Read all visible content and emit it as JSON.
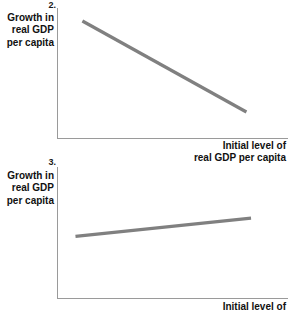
{
  "page": {
    "background": "#ffffff",
    "text_color": "#111111",
    "axis_color": "#9a9a9a",
    "line_color": "#808080"
  },
  "figures": [
    {
      "number": "2.",
      "y_axis_label_lines": [
        "Growth in",
        "real GDP",
        "per capita"
      ],
      "x_axis_label_lines": [
        "Initial level of",
        "real GDP per capita"
      ],
      "chart_data": {
        "type": "line",
        "title": "2.",
        "xlabel": "Initial level of real GDP per capita",
        "ylabel": "Growth in real GDP per capita",
        "grid": false,
        "legend": "none",
        "axis_ticks": "none",
        "series": [
          {
            "name": "negative relationship",
            "relationship": "decreasing",
            "x": [
              0.11,
              0.82
            ],
            "y": [
              0.9,
              0.2
            ]
          }
        ],
        "xlim": [
          0,
          1
        ],
        "ylim": [
          0,
          1
        ],
        "annotation": "Downward-sloping straight line: higher initial real GDP per capita associated with lower growth (convergence)."
      }
    },
    {
      "number": "3.",
      "y_axis_label_lines": [
        "Growth in",
        "real GDP",
        "per capita"
      ],
      "x_axis_label_lines": [
        "Initial level of"
      ],
      "chart_data": {
        "type": "line",
        "title": "3.",
        "xlabel": "Initial level of",
        "ylabel": "Growth in real GDP per capita",
        "grid": false,
        "legend": "none",
        "axis_ticks": "none",
        "series": [
          {
            "name": "positive relationship",
            "relationship": "increasing",
            "x": [
              0.08,
              0.84
            ],
            "y": [
              0.47,
              0.61
            ]
          }
        ],
        "xlim": [
          0,
          1
        ],
        "ylim": [
          0,
          1
        ],
        "annotation": "Gently upward-sloping straight line: higher initial real GDP per capita associated with slightly higher growth (divergence)."
      }
    }
  ]
}
